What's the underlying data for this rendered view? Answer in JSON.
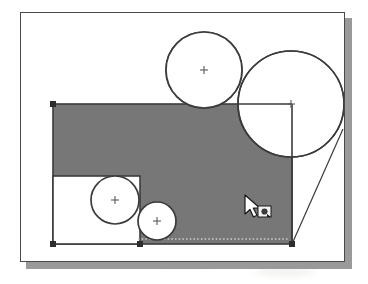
{
  "app": {
    "type": "cad-drawing-canvas",
    "title": "Drawing Canvas",
    "background_color": "#ffffff",
    "frame_border_color": "#4a4a4a",
    "shadow_color": "#9a9a9a"
  },
  "canvas": {
    "frame": {
      "x": 20,
      "y": 12,
      "width": 325,
      "height": 250
    },
    "shadow_offset": {
      "x": 6,
      "y": 6
    }
  },
  "colors": {
    "fill_gray": "#777777",
    "outline_dark": "#3b3b3b",
    "handle_dark": "#2e2e2e",
    "white": "#ffffff",
    "dashed_light": "#cfcfcf"
  },
  "shapes": [
    {
      "name": "selected-gray-rectangle",
      "kind": "rectangle",
      "fill": "#777777",
      "stroke": "#3b3b3b",
      "selected": true,
      "x": 52,
      "y": 103,
      "width": 239,
      "height": 140
    },
    {
      "name": "inner-white-rectangle",
      "kind": "rectangle",
      "fill": "#ffffff",
      "stroke": "#3b3b3b",
      "selected": false,
      "x": 52,
      "y": 175,
      "width": 87,
      "height": 68
    },
    {
      "name": "top-circle",
      "kind": "circle",
      "fill": "#ffffff",
      "stroke": "#3b3b3b",
      "cx": 203,
      "cy": 69,
      "r": 38,
      "center_marker": "plus"
    },
    {
      "name": "large-right-circle",
      "kind": "circle",
      "fill": "#ffffff",
      "stroke": "#3b3b3b",
      "cx": 290,
      "cy": 103,
      "r": 53,
      "center_marker": "plus"
    },
    {
      "name": "medium-inner-circle",
      "kind": "circle",
      "fill": "#ffffff",
      "stroke": "#3b3b3b",
      "cx": 114,
      "cy": 199,
      "r": 24,
      "center_marker": "plus"
    },
    {
      "name": "small-bottom-circle",
      "kind": "circle",
      "fill": "#ffffff",
      "stroke": "#3b3b3b",
      "cx": 156,
      "cy": 220,
      "r": 19,
      "center_marker": "plus"
    },
    {
      "name": "tangent-construction-line",
      "kind": "line",
      "stroke": "#3b3b3b",
      "x1": 291,
      "y1": 243,
      "x2": 342,
      "y2": 128
    },
    {
      "name": "dashed-guide-line",
      "kind": "dashed-line",
      "stroke": "#cfcfcf",
      "x1": 137,
      "y1": 238,
      "x2": 288,
      "y2": 238
    }
  ],
  "selection_handles": [
    {
      "name": "handle-top-left",
      "x": 52,
      "y": 103
    },
    {
      "name": "handle-bottom-left",
      "x": 52,
      "y": 243
    },
    {
      "name": "handle-bottom-mid",
      "x": 139,
      "y": 243
    },
    {
      "name": "handle-bottom-right",
      "x": 291,
      "y": 243
    }
  ],
  "center_markers": [
    {
      "name": "center-marker-top-circle",
      "x": 203,
      "y": 69
    },
    {
      "name": "center-marker-large-circle",
      "x": 290,
      "y": 103
    },
    {
      "name": "center-marker-medium-circle",
      "x": 114,
      "y": 199
    },
    {
      "name": "center-marker-small-circle",
      "x": 156,
      "y": 220
    }
  ],
  "cursor": {
    "name": "mouse-pointer-with-shape-badge",
    "x": 245,
    "y": 196,
    "badge_label": "shape-tool-badge",
    "badge_x": 260,
    "badge_y": 208
  }
}
